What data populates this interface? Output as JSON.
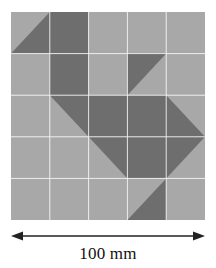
{
  "figure": {
    "dimension": {
      "label": "100 mm",
      "value": 100,
      "unit": "mm",
      "orientation": "horizontal",
      "arrow_style": "double-headed",
      "arrow_color": "#222222"
    }
  },
  "chart_data": {
    "type": "heatmap",
    "xlabel": "",
    "ylabel": "",
    "rows": 5,
    "cols": 5,
    "cell_size_mm": 20,
    "grid": true,
    "grid_line_color": "#f4f4f4",
    "legend": [
      {
        "name": "light",
        "color": "#a8a8a8"
      },
      {
        "name": "dark",
        "color": "#6e6e6e"
      }
    ],
    "shade_codes": {
      "0": "light (whole cell light gray)",
      "1": "dark (whole cell dark gray)",
      "TL": "dark triangle occupying upper-left half",
      "TR": "dark triangle occupying upper-right half",
      "BL": "dark triangle occupying lower-left half",
      "BR": "dark triangle occupying lower-right half"
    },
    "cells": [
      [
        "BR",
        "1",
        "0",
        "0",
        "0"
      ],
      [
        "0",
        "1",
        "0",
        "TL",
        "0"
      ],
      [
        "0",
        "TR",
        "1",
        "1",
        "BL"
      ],
      [
        "0",
        "0",
        "TR",
        "1",
        "TL"
      ],
      [
        "0",
        "0",
        "0",
        "BR",
        "0"
      ]
    ],
    "dark_fraction_per_row": [
      1.5,
      1.5,
      3.0,
      2.0,
      0.5
    ],
    "total_dark_cells_equivalent": 8.5,
    "total_cells": 25
  }
}
